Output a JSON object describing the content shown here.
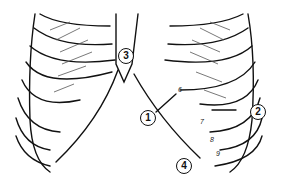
{
  "diagram": {
    "callouts": [
      {
        "id": "1",
        "label": "1"
      },
      {
        "id": "2",
        "label": "2"
      },
      {
        "id": "3",
        "label": "3"
      },
      {
        "id": "4",
        "label": "4"
      }
    ],
    "rib_numbers": [
      "6",
      "7",
      "8",
      "9"
    ],
    "colors": {
      "line": "#111111",
      "background": "#ffffff"
    }
  }
}
